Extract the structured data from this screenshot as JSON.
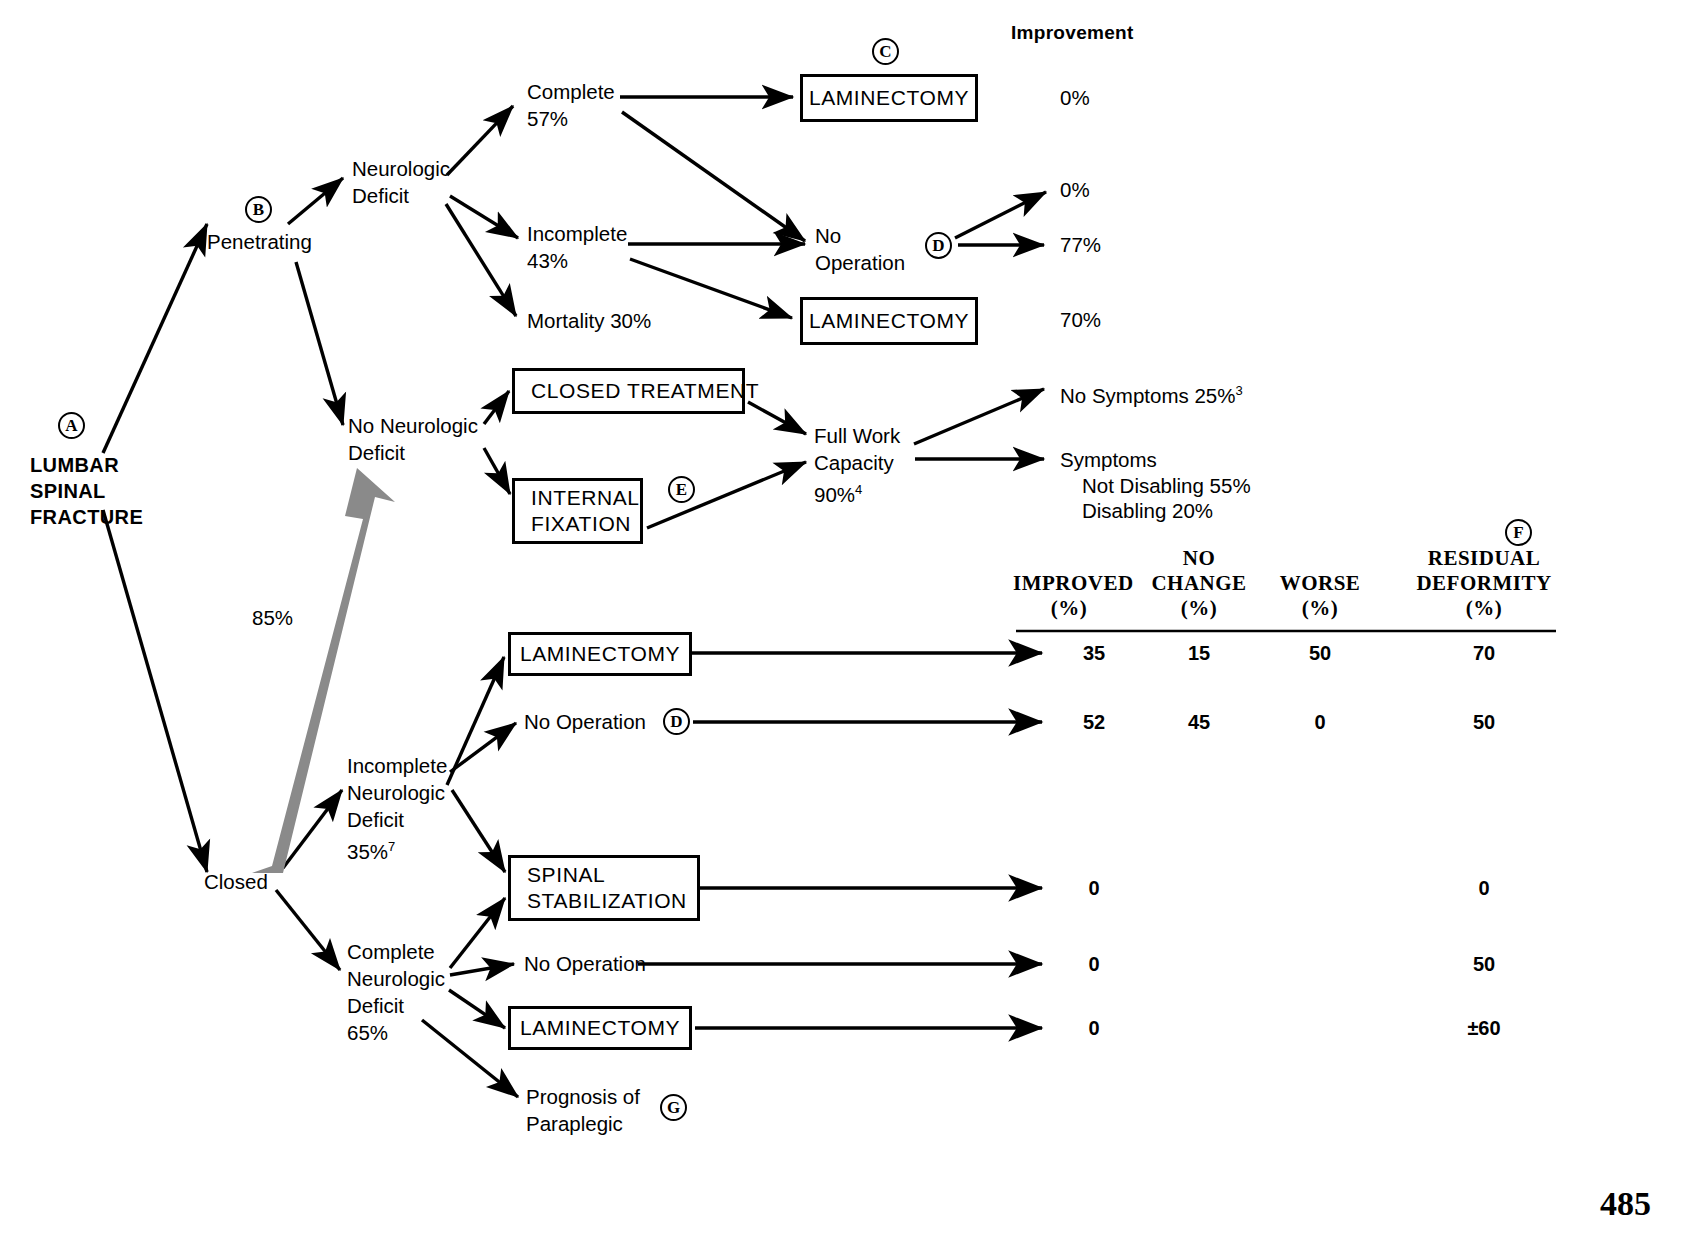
{
  "diagram": {
    "improvement_header": "Improvement",
    "page_number": "485",
    "root": {
      "label": "LUMBAR\nSPINAL\nFRACTURE",
      "marker": "A"
    },
    "branches": {
      "penetrating": {
        "label": "Penetrating",
        "marker": "B"
      },
      "closed": {
        "label": "Closed"
      },
      "grey_arrow_label": "85%"
    },
    "penetrating_nodes": {
      "neurologic_deficit": "Neurologic\nDeficit",
      "complete": "Complete\n57%",
      "incomplete": "Incomplete\n43%",
      "mortality": "Mortality 30%",
      "no_operation": "No\nOperation",
      "laminectomy_top": "LAMINECTOMY",
      "laminectomy_mid": "LAMINECTOMY",
      "marker_c": "C",
      "marker_d": "D",
      "improvement_laminectomy_top": "0%",
      "improvement_no_op_upper": "0%",
      "improvement_no_op_lower": "77%",
      "improvement_laminectomy_mid": "70%"
    },
    "no_deficit_nodes": {
      "no_neurologic_deficit": "No Neurologic\nDeficit",
      "closed_treatment": "CLOSED TREATMENT",
      "internal_fixation": "INTERNAL\nFIXATION",
      "marker_e": "E",
      "full_work_capacity": "Full Work\nCapacity\n90%",
      "full_work_capacity_sup": "4",
      "no_symptoms": "No Symptoms 25%",
      "no_symptoms_sup": "3",
      "symptoms": "Symptoms",
      "symptoms_not_disabling": "Not Disabling 55%",
      "symptoms_disabling": "Disabling 20%"
    },
    "closed_nodes": {
      "incomplete_deficit": "Incomplete\nNeurologic\nDeficit\n35%",
      "incomplete_deficit_sup": "7",
      "complete_deficit": "Complete\nNeurologic\nDeficit\n65%",
      "laminectomy_incomplete": "LAMINECTOMY",
      "no_operation_incomplete": "No Operation",
      "marker_d2": "D",
      "spinal_stabilization": "SPINAL\nSTABILIZATION",
      "no_operation_complete": "No Operation",
      "laminectomy_complete": "LAMINECTOMY",
      "prognosis_paraplegic": "Prognosis of\nParaplegic",
      "marker_g": "G"
    },
    "table": {
      "marker_f": "F",
      "columns": [
        {
          "name": "improved",
          "title": "IMPROVED",
          "unit": "(%)"
        },
        {
          "name": "no-change",
          "title": "NO\nCHANGE",
          "unit": "(%)"
        },
        {
          "name": "worse",
          "title": "WORSE",
          "unit": "(%)"
        },
        {
          "name": "residual-deformity",
          "title": "RESIDUAL\nDEFORMITY",
          "unit": "(%)"
        }
      ],
      "rows": [
        {
          "label": "LAMINECTOMY",
          "improved": "35",
          "no_change": "15",
          "worse": "50",
          "residual_deformity": "70"
        },
        {
          "label": "No Operation",
          "improved": "52",
          "no_change": "45",
          "worse": "0",
          "residual_deformity": "50"
        },
        {
          "label": "SPINAL STABILIZATION",
          "improved": "0",
          "no_change": "",
          "worse": "",
          "residual_deformity": "0"
        },
        {
          "label": "No Operation",
          "improved": "0",
          "no_change": "",
          "worse": "",
          "residual_deformity": "50"
        },
        {
          "label": "LAMINECTOMY",
          "improved": "0",
          "no_change": "",
          "worse": "",
          "residual_deformity": "±60"
        }
      ]
    }
  },
  "colors": {
    "ink": "#000000",
    "background": "#ffffff",
    "grey_arrow": "#8a8a8a"
  }
}
